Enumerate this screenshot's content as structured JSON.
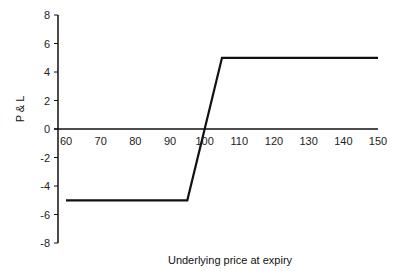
{
  "chart_data": {
    "type": "line",
    "title": "",
    "xlabel": "Underlying price at expiry",
    "ylabel": "P & L",
    "xlim": [
      60,
      150
    ],
    "ylim": [
      -8,
      8
    ],
    "x_ticks": [
      60,
      70,
      80,
      90,
      100,
      110,
      120,
      130,
      140,
      150
    ],
    "y_ticks": [
      -8,
      -6,
      -4,
      -2,
      0,
      2,
      4,
      6,
      8
    ],
    "x_tick_labels": [
      "60",
      "70",
      "80",
      "90",
      "100",
      "110",
      "120",
      "130",
      "140",
      "150"
    ],
    "y_tick_labels": [
      "-8",
      "-6",
      "-4",
      "-2",
      "0",
      "2",
      "4",
      "6",
      "8"
    ],
    "grid": false,
    "legend": null,
    "series": [
      {
        "name": "P&L",
        "color": "#111111",
        "x": [
          60,
          95,
          105,
          150
        ],
        "y": [
          -5,
          -5,
          5,
          5
        ]
      }
    ]
  }
}
